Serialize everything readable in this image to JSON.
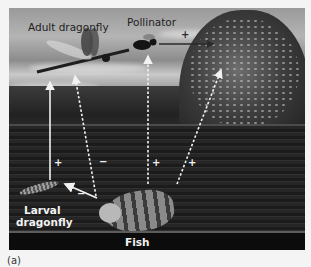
{
  "figure": {
    "caption": "(a)",
    "organisms": {
      "adult_dragonfly": "Adult dragonfly",
      "pollinator": "Pollinator",
      "larval_dragonfly_line1": "Larval",
      "larval_dragonfly_line2": "dragonfly",
      "fish": "Fish"
    },
    "interactions": [
      {
        "from": "Larval dragonfly",
        "to": "Adult dragonfly",
        "style": "solid",
        "sign": "+"
      },
      {
        "from": "Fish",
        "to": "Adult dragonfly",
        "style": "dashed",
        "sign": "−"
      },
      {
        "from": "Fish",
        "to": "Pollinator",
        "style": "dashed",
        "sign": "+"
      },
      {
        "from": "Fish",
        "to": "Plant",
        "style": "dashed",
        "sign": "+"
      },
      {
        "from": "Fish",
        "to": "Larval dragonfly",
        "style": "solid",
        "sign": "−"
      },
      {
        "from": "Pollinator",
        "to": "Plant",
        "style": "solid",
        "sign": "+"
      }
    ],
    "signs": {
      "larval_to_adult": "+",
      "fish_to_adult": "−",
      "fish_to_pollinator": "+",
      "fish_to_plant": "+",
      "fish_to_larval": "−",
      "pollinator_to_plant": "+"
    },
    "colors": {
      "arrow": "#f2f2f2",
      "label_dark": "#1e1e1e",
      "label_light": "#f2f2f2"
    }
  }
}
